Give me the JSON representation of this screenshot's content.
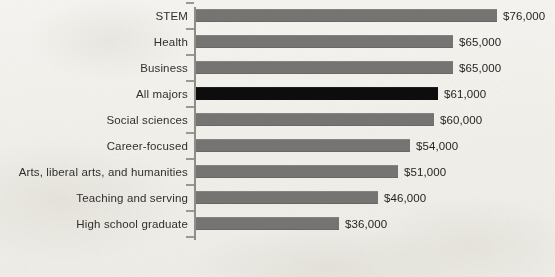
{
  "chart_data": {
    "type": "bar",
    "orientation": "horizontal",
    "title": "",
    "subtitle": "",
    "xlabel": "",
    "ylabel": "",
    "categories": [
      "STEM",
      "Health",
      "Business",
      "All majors",
      "Social sciences",
      "Career-focused",
      "Arts, liberal arts, and humanities",
      "Teaching and serving",
      "High school graduate"
    ],
    "values": [
      76000,
      65000,
      65000,
      61000,
      60000,
      54000,
      51000,
      46000,
      36000
    ],
    "value_labels": [
      "$76,000",
      "$65,000",
      "$65,000",
      "$61,000",
      "$60,000",
      "$54,000",
      "$51,000",
      "$46,000",
      "$36,000"
    ],
    "highlight_index": 3,
    "xlim": [
      0,
      76000
    ],
    "grid": false,
    "legend": null,
    "colors": {
      "bar": "#757472",
      "bar_highlight": "#0d0d0d",
      "background": "#f2f1ed",
      "axis": "#8f8d88",
      "text": "#2f2f2f"
    }
  }
}
